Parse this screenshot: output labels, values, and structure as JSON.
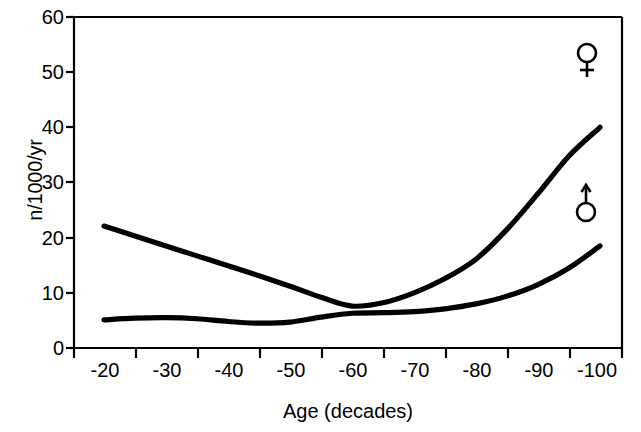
{
  "chart_data": {
    "type": "line",
    "title": "",
    "xlabel": "Age (decades)",
    "ylabel": "n/1000/yr",
    "xtick_labels": [
      "-20",
      "-30",
      "-40",
      "-50",
      "-60",
      "-70",
      "-80",
      "-90",
      "-100"
    ],
    "ytick_labels": [
      "0",
      "10",
      "20",
      "30",
      "40",
      "50",
      "60"
    ],
    "ytick_values": [
      0,
      10,
      20,
      30,
      40,
      50,
      60
    ],
    "ylim": [
      0,
      60
    ],
    "xlim": [
      -15,
      -105
    ],
    "grid": false,
    "legend_position": "inline-right",
    "series": [
      {
        "name": "female",
        "symbol": "venus-symbol",
        "label": "♀",
        "color": "#000000",
        "x": [
          -20,
          -25,
          -30,
          -35,
          -40,
          -45,
          -50,
          -55,
          -60,
          -65,
          -70,
          -75,
          -80,
          -85,
          -90,
          -95,
          -100
        ],
        "values": [
          22.1,
          20.3,
          18.5,
          16.7,
          14.9,
          13.1,
          11.2,
          9.2,
          7.6,
          8.2,
          10.0,
          12.6,
          16.1,
          21.5,
          28.0,
          34.8,
          40.0
        ]
      },
      {
        "name": "male",
        "symbol": "mars-symbol",
        "label": "♂",
        "color": "#000000",
        "x": [
          -20,
          -25,
          -30,
          -35,
          -40,
          -45,
          -50,
          -55,
          -60,
          -65,
          -70,
          -75,
          -80,
          -85,
          -90,
          -95,
          -100
        ],
        "values": [
          5.1,
          5.4,
          5.5,
          5.3,
          4.8,
          4.5,
          4.7,
          5.6,
          6.3,
          6.4,
          6.6,
          7.1,
          8.0,
          9.4,
          11.5,
          14.5,
          18.5
        ]
      }
    ],
    "annotations": [
      {
        "name": "venus-symbol",
        "glyph": "♀",
        "series": "female",
        "value_near": 53
      },
      {
        "name": "mars-symbol",
        "glyph": "♂",
        "series": "male",
        "value_near": 27
      }
    ]
  },
  "axes": {
    "ylabel": "n/1000/yr",
    "xlabel": "Age (decades)",
    "yticks": [
      "60",
      "50",
      "40",
      "30",
      "20",
      "10",
      "0"
    ],
    "xticks": [
      "-20",
      "-30",
      "-40",
      "-50",
      "-60",
      "-70",
      "-80",
      "-90",
      "-100"
    ]
  }
}
